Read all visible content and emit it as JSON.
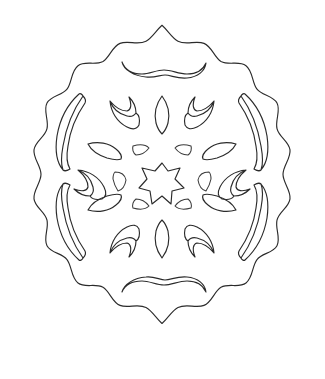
{
  "page": {
    "title": "Snowflake Doily Coloring Page",
    "background_color": "#ffffff",
    "ink_color": "#2b2b2b",
    "width": 325,
    "height": 379
  },
  "artwork": {
    "name": "paper-cut snowflake doily",
    "style": "hand-drawn black line art, uncolored",
    "center": {
      "x": 162,
      "y": 186
    },
    "bounds": {
      "left": 20,
      "top": 25,
      "right": 305,
      "bottom": 347
    },
    "symmetry": "bilateral, near 6-fold radial",
    "elements": [
      {
        "name": "outer-scalloped-border",
        "kind": "wavy-closed-outline",
        "description": "continuous undulating scalloped ring forming the snowflake silhouette",
        "lobe_count": 16
      },
      {
        "name": "top-arc-cutout",
        "kind": "crescent-band",
        "position": "top-center"
      },
      {
        "name": "bottom-arc-cutout",
        "kind": "crescent-band",
        "position": "bottom-center"
      },
      {
        "name": "upper-left-sickle-cutout",
        "kind": "long-sickle",
        "position": "upper-left"
      },
      {
        "name": "upper-right-sickle-cutout",
        "kind": "long-sickle",
        "position": "upper-right"
      },
      {
        "name": "lower-left-sickle-cutout",
        "kind": "long-sickle",
        "position": "lower-left"
      },
      {
        "name": "lower-right-sickle-cutout",
        "kind": "long-sickle",
        "position": "lower-right"
      },
      {
        "name": "upper-left-horn-cutout",
        "kind": "horned-wedge",
        "position": "ring-2 upper-left"
      },
      {
        "name": "upper-right-horn-cutout",
        "kind": "horned-wedge",
        "position": "ring-2 upper-right"
      },
      {
        "name": "lower-left-horn-cutout",
        "kind": "horned-wedge",
        "position": "ring-2 lower-left"
      },
      {
        "name": "lower-right-horn-cutout",
        "kind": "horned-wedge",
        "position": "ring-2 lower-right"
      },
      {
        "name": "left-horn-cutout",
        "kind": "horned-wedge",
        "position": "ring-2 left"
      },
      {
        "name": "right-horn-cutout",
        "kind": "horned-wedge",
        "position": "ring-2 right"
      },
      {
        "name": "top-center-leaf-cutout",
        "kind": "almond-leaf",
        "position": "ring-2 top-center"
      },
      {
        "name": "bottom-center-leaf-cutout",
        "kind": "almond-leaf",
        "position": "ring-2 bottom-center"
      },
      {
        "name": "upper-left-leaf-cutout",
        "kind": "almond-leaf",
        "position": "ring-3 upper-left"
      },
      {
        "name": "upper-right-leaf-cutout",
        "kind": "almond-leaf",
        "position": "ring-3 upper-right"
      },
      {
        "name": "lower-left-leaf-cutout",
        "kind": "almond-leaf",
        "position": "ring-3 lower-left"
      },
      {
        "name": "lower-right-leaf-cutout",
        "kind": "almond-leaf",
        "position": "ring-3 lower-right"
      },
      {
        "name": "inner-upper-left-petal",
        "kind": "small-petal",
        "position": "ring-4 upper-left"
      },
      {
        "name": "inner-upper-right-petal",
        "kind": "small-petal",
        "position": "ring-4 upper-right"
      },
      {
        "name": "inner-lower-left-petal",
        "kind": "small-petal",
        "position": "ring-4 lower-left"
      },
      {
        "name": "inner-lower-right-petal",
        "kind": "small-petal",
        "position": "ring-4 lower-right"
      },
      {
        "name": "inner-left-petal",
        "kind": "small-petal",
        "position": "ring-4 left"
      },
      {
        "name": "inner-right-petal",
        "kind": "small-petal",
        "position": "ring-4 right"
      },
      {
        "name": "center-star-cutout",
        "kind": "six-pointed-star",
        "position": "center",
        "points": 6
      }
    ]
  }
}
